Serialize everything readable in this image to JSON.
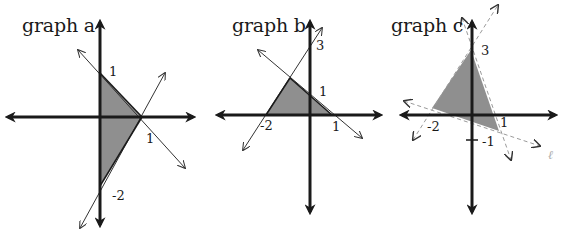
{
  "figure": {
    "graphs": [
      {
        "id": "a",
        "title": "graph a",
        "labels": {
          "y_pos": "1",
          "x_pos": "1",
          "y_neg": "-2"
        },
        "region_vertices": [
          [
            0,
            1
          ],
          [
            1,
            0
          ],
          [
            0,
            -2
          ]
        ],
        "boundary_style": "solid",
        "lines": [
          "y = -x + 1",
          "y = 2x - 2",
          "x = 0"
        ]
      },
      {
        "id": "b",
        "title": "graph b",
        "labels": {
          "y_top": "3",
          "y_pos": "1",
          "x_neg": "-2",
          "x_pos": "1"
        },
        "region_vertices": [
          [
            -2,
            0
          ],
          [
            1,
            0
          ],
          [
            -1,
            1.5
          ]
        ],
        "boundary_style": "solid",
        "lines": [
          "y = -x + 1",
          "y = 1.5x + 3",
          "y = 0"
        ]
      },
      {
        "id": "c",
        "title": "graph c",
        "labels": {
          "y_top": "3",
          "x_neg": "-2",
          "x_pos": "1",
          "y_neg": "-1"
        },
        "region_vertices": [
          [
            0,
            3
          ],
          [
            -2,
            0.2
          ],
          [
            1,
            -0.6
          ]
        ],
        "boundary_style": "dashed",
        "extra_label": "ℓ"
      }
    ],
    "colors": {
      "axis": "#1a1a1a",
      "region_fill": "#8f8f8f",
      "line": "#333333",
      "dashed_line": "#9a9a9a"
    }
  }
}
